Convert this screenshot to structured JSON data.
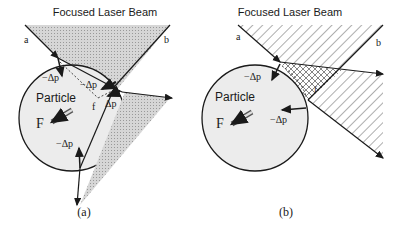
{
  "panels": [
    {
      "title": "Focused Laser Beam",
      "caption": "(a)",
      "particle_label": "Particle",
      "force_label": "F",
      "ray_labels": {
        "a": "a",
        "b": "b",
        "f": "f"
      },
      "momentum_labels": [
        "−Δp",
        "−Δp",
        "Δp",
        "−Δp"
      ]
    },
    {
      "title": "Focused Laser Beam",
      "caption": "(b)",
      "particle_label": "Particle",
      "force_label": "F",
      "ray_labels": {
        "a": "a",
        "b": "b",
        "f": "f"
      },
      "momentum_labels": [
        "−Δp",
        "−Δp"
      ]
    }
  ],
  "colors": {
    "stroke": "#1a1a1a",
    "particle_fill": "#ececec",
    "beam_fill": "#c8c8c8"
  }
}
